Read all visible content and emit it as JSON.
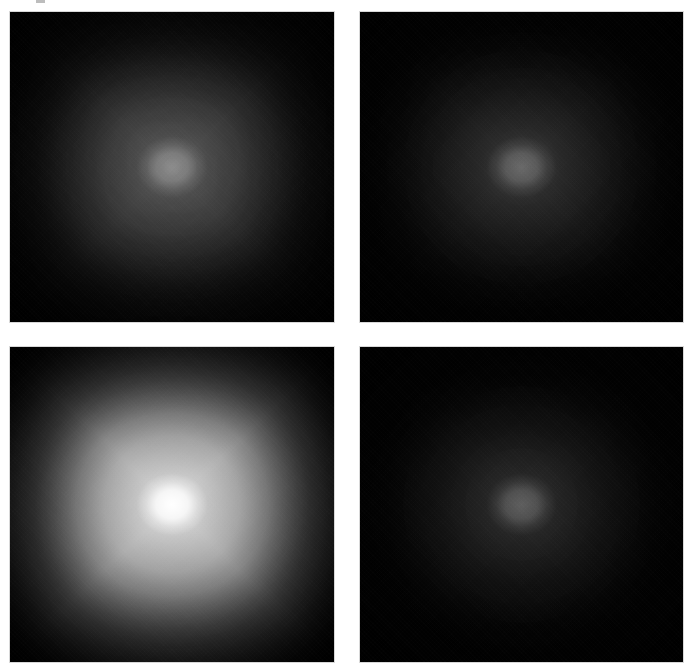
{
  "figure": {
    "type": "image-grid",
    "background_color": "#ffffff",
    "panel_border_color": "#d8d8d8",
    "width_px": 693,
    "height_px": 672
  },
  "chart_data": {
    "type": "heatmap",
    "title": "",
    "subtitle": "",
    "xlabel": "",
    "ylabel": "",
    "grid": false,
    "legend_position": "none",
    "colormap": "gray",
    "layout": {
      "rows": 2,
      "cols": 2
    },
    "panels": [
      {
        "id": "panel-top-left",
        "row": 0,
        "col": 0,
        "label": "",
        "x_px": 10,
        "y_px": 12,
        "width_px": 324,
        "height_px": 310,
        "pattern": "four-ray star, diffuse",
        "peak_intensity": 0.27,
        "halo_intensity": 0.2,
        "ray_intensity": 0.12,
        "edge_intensity": 0.02,
        "background_gray": "#000000",
        "center_gray": "#45454a"
      },
      {
        "id": "panel-top-right",
        "row": 0,
        "col": 1,
        "label": "",
        "x_px": 360,
        "y_px": 12,
        "width_px": 323,
        "height_px": 310,
        "pattern": "broad diffuse glow, no rays",
        "peak_intensity": 0.23,
        "halo_intensity": 0.19,
        "ray_intensity": 0.03,
        "edge_intensity": 0.02,
        "background_gray": "#000000",
        "center_gray": "#3b3b3f"
      },
      {
        "id": "panel-bottom-left",
        "row": 1,
        "col": 0,
        "label": "",
        "x_px": 10,
        "y_px": 347,
        "width_px": 324,
        "height_px": 315,
        "pattern": "four-ray star, bright saturated core",
        "peak_intensity": 1.0,
        "halo_intensity": 0.46,
        "ray_intensity": 0.52,
        "edge_intensity": 0.03,
        "background_gray": "#000000",
        "center_gray": "#e8e8e8"
      },
      {
        "id": "panel-bottom-right",
        "row": 1,
        "col": 1,
        "label": "",
        "x_px": 360,
        "y_px": 347,
        "width_px": 323,
        "height_px": 315,
        "pattern": "broad diffuse glow, no rays",
        "peak_intensity": 0.21,
        "halo_intensity": 0.17,
        "ray_intensity": 0.02,
        "edge_intensity": 0.02,
        "background_gray": "#000000",
        "center_gray": "#363639"
      }
    ]
  }
}
